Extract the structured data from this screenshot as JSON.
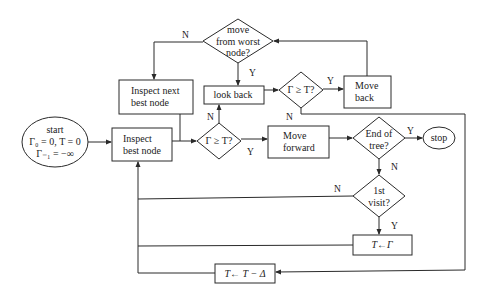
{
  "diagram": {
    "type": "flowchart",
    "nodes": {
      "start": {
        "shape": "ellipse",
        "lines": [
          "start",
          "Γ₀ = 0, T = 0",
          "Γ₋₁ = −∞"
        ]
      },
      "inspect_best": {
        "shape": "rect",
        "lines": [
          "Inspect",
          "best node"
        ]
      },
      "inspect_next": {
        "shape": "rect",
        "lines": [
          "Inspect next",
          "best node"
        ]
      },
      "move_from_worst": {
        "shape": "diamond",
        "lines": [
          "move",
          "from worst",
          "node?"
        ]
      },
      "look_back": {
        "shape": "rect",
        "lines": [
          "look back"
        ]
      },
      "check_top": {
        "shape": "diamond",
        "lines": [
          "Γ ≥ T?"
        ]
      },
      "move_back": {
        "shape": "rect",
        "lines": [
          "Move",
          "back"
        ]
      },
      "check_mid": {
        "shape": "diamond",
        "lines": [
          "Γ ≥ T?"
        ]
      },
      "move_forward": {
        "shape": "rect",
        "lines": [
          "Move",
          "forward"
        ]
      },
      "end_of_tree": {
        "shape": "diamond",
        "lines": [
          "End of",
          "tree?"
        ]
      },
      "stop": {
        "shape": "ellipse",
        "lines": [
          "stop"
        ]
      },
      "first_visit": {
        "shape": "diamond",
        "lines": [
          "1st",
          "visit?"
        ]
      },
      "t_gets_gamma": {
        "shape": "rect",
        "lines": [
          "T←Γ"
        ]
      },
      "t_minus_delta": {
        "shape": "rect",
        "lines": [
          "T← T − Δ"
        ]
      }
    },
    "edge_labels": {
      "move_from_worst_no": "N",
      "move_from_worst_yes": "Y",
      "check_top_yes": "Y",
      "check_top_no": "N",
      "check_mid_no": "N",
      "check_mid_yes": "Y",
      "end_of_tree_yes": "Y",
      "end_of_tree_no": "N",
      "first_visit_no": "N",
      "first_visit_yes": "Y"
    },
    "edges": [
      {
        "from": "start",
        "to": "inspect_best"
      },
      {
        "from": "inspect_best",
        "to": "check_mid"
      },
      {
        "from": "inspect_next",
        "to": "check_mid"
      },
      {
        "from": "check_mid",
        "to": "move_forward",
        "label": "Y"
      },
      {
        "from": "check_mid",
        "to": "look_back",
        "label": "N"
      },
      {
        "from": "look_back",
        "to": "check_top"
      },
      {
        "from": "check_top",
        "to": "move_back",
        "label": "Y"
      },
      {
        "from": "check_top",
        "to": "t_minus_delta",
        "label": "N"
      },
      {
        "from": "move_back",
        "to": "move_from_worst"
      },
      {
        "from": "move_from_worst",
        "to": "look_back",
        "label": "Y"
      },
      {
        "from": "move_from_worst",
        "to": "inspect_next",
        "label": "N"
      },
      {
        "from": "move_forward",
        "to": "end_of_tree"
      },
      {
        "from": "end_of_tree",
        "to": "stop",
        "label": "Y"
      },
      {
        "from": "end_of_tree",
        "to": "first_visit",
        "label": "N"
      },
      {
        "from": "first_visit",
        "to": "t_gets_gamma",
        "label": "Y"
      },
      {
        "from": "first_visit",
        "to": "inspect_best",
        "label": "N"
      },
      {
        "from": "t_gets_gamma",
        "to": "inspect_best"
      },
      {
        "from": "t_minus_delta",
        "to": "inspect_best"
      }
    ],
    "colors": {
      "stroke": "#2a2a2a",
      "text": "#222222",
      "background": "#ffffff"
    }
  }
}
